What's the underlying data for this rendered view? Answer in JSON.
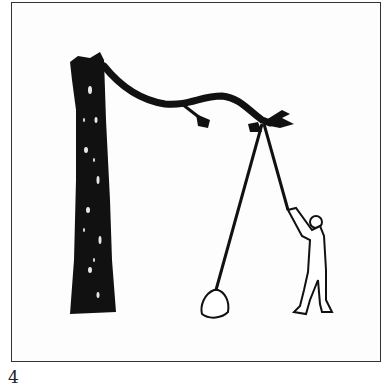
{
  "figure": {
    "number": "4",
    "colors": {
      "ink": "#111111",
      "paper": "#ffffff",
      "frame": "#333333"
    },
    "elements": [
      "frame",
      "tree-trunk",
      "branch",
      "pine-tufts",
      "rope",
      "bag",
      "person"
    ]
  }
}
